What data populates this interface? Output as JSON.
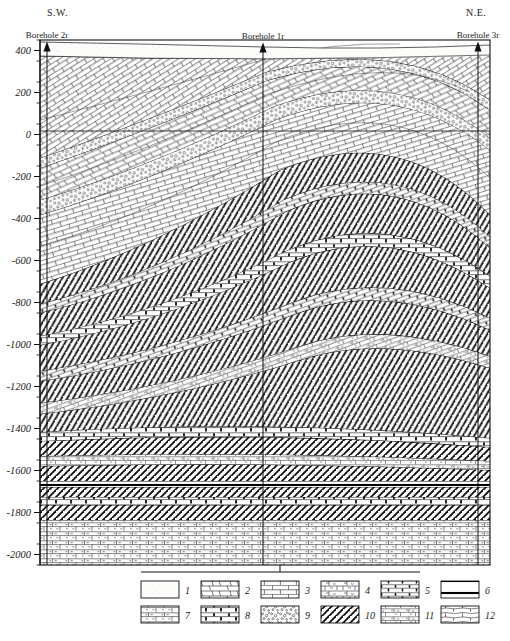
{
  "figure": {
    "orientation_left": "S.W.",
    "orientation_right": "N.E.",
    "depth_axis_unit": "m",
    "frame": {
      "x": 40,
      "y": 40,
      "width": 450,
      "height": 525
    }
  },
  "axis": {
    "ticks_labeled": [
      "400",
      "200",
      "0",
      "-200",
      "-400",
      "-600",
      "-800",
      "-1000",
      "-1200",
      "-1400",
      "-1600",
      "-1800",
      "-2000"
    ],
    "values": [
      400,
      200,
      0,
      -200,
      -400,
      -600,
      -800,
      -1000,
      -1200,
      -1400,
      -1600,
      -1800,
      -2000
    ],
    "minor_step": 100,
    "top_value": 450,
    "bottom_value": -2050
  },
  "boreholes": [
    {
      "id": "bh2r",
      "label": "Borehole 2r",
      "x_px": 47,
      "top_value": 400
    },
    {
      "id": "bh1r",
      "label": "Borehole 1r",
      "x_px": 263,
      "top_value": 395
    },
    {
      "id": "bh3r",
      "label": "Borehole 3r",
      "x_px": 478,
      "top_value": 400
    }
  ],
  "legend": {
    "rows": 2,
    "columns": 6,
    "items": [
      {
        "n": "1",
        "pattern": "blank-stipple",
        "name": "swatch-1"
      },
      {
        "n": "2",
        "pattern": "slanted-brick",
        "name": "swatch-2"
      },
      {
        "n": "3",
        "pattern": "regular-brick",
        "name": "swatch-3"
      },
      {
        "n": "4",
        "pattern": "brick-squiggle",
        "name": "swatch-4"
      },
      {
        "n": "5",
        "pattern": "brick-vertical-tick",
        "name": "swatch-5"
      },
      {
        "n": "6",
        "pattern": "double-heavy-line",
        "name": "swatch-6"
      },
      {
        "n": "7",
        "pattern": "brick-dash",
        "name": "swatch-7"
      },
      {
        "n": "8",
        "pattern": "brick-thick-joint",
        "name": "swatch-8"
      },
      {
        "n": "9",
        "pattern": "conglomerate-dots",
        "name": "swatch-9"
      },
      {
        "n": "10",
        "pattern": "diagonal-hatch",
        "name": "swatch-10"
      },
      {
        "n": "11",
        "pattern": "brick-fine-squiggle",
        "name": "swatch-11"
      },
      {
        "n": "12",
        "pattern": "brick-wavy",
        "name": "swatch-12"
      }
    ]
  },
  "chart_data": {
    "type": "cross-section",
    "xlabel": "",
    "ylabel": "Elevation (m)",
    "ylim": [
      -2050,
      450
    ],
    "grid": false,
    "structure": "Asymmetric anticline with crest beneath the NE half; gently dipping cover beds above, strongly folded hatched/brick alternation in the core, flat-lying beds at depth.",
    "strata": [
      {
        "unit": 1,
        "legend": "1",
        "name": "topsoil-quaternary",
        "top_at_bh2r": 400,
        "base_at_bh2r": 370,
        "fold": "flat"
      },
      {
        "unit": 2,
        "legend": "2",
        "name": "upper-limestone",
        "top_at_bh2r": 370,
        "base_at_bh2r": 120,
        "fold": "gentle-dip-NE"
      },
      {
        "unit": 3,
        "legend": "9",
        "name": "marker-conglomerate-A",
        "top_at_bh2r": 120,
        "base_at_bh2r": 60,
        "fold": "gentle-dip-NE"
      },
      {
        "unit": 4,
        "legend": "3",
        "name": "massive-limestone",
        "top_at_bh2r": 60,
        "base_at_bh2r": -150,
        "fold": "gentle-dip-NE"
      },
      {
        "unit": 5,
        "legend": "9",
        "name": "marker-conglomerate-B",
        "top_at_bh2r": -150,
        "base_at_bh2r": -215,
        "fold": "gentle-dip-NE"
      },
      {
        "unit": 6,
        "legend": "3",
        "name": "lower-limestone",
        "top_at_bh2r": -215,
        "base_at_bh2r": -760,
        "fold": "gentle-dip-NE"
      },
      {
        "unit": 7,
        "legend": "10",
        "name": "hatched-argillite-1",
        "top_at_bh2r": -760,
        "base_at_bh2r": -960,
        "fold": "anticline"
      },
      {
        "unit": 8,
        "legend": "5",
        "name": "banded-dolomite-1",
        "top_at_bh2r": -960,
        "base_at_bh2r": -1030,
        "fold": "anticline"
      },
      {
        "unit": 9,
        "legend": "10",
        "name": "hatched-argillite-2",
        "top_at_bh2r": -1030,
        "base_at_bh2r": -1180,
        "fold": "anticline"
      },
      {
        "unit": 10,
        "legend": "8",
        "name": "banded-dolomite-2",
        "top_at_bh2r": -1180,
        "base_at_bh2r": -1250,
        "fold": "anticline"
      },
      {
        "unit": 11,
        "legend": "10",
        "name": "hatched-argillite-3",
        "top_at_bh2r": -1250,
        "base_at_bh2r": -1420,
        "fold": "anticline"
      },
      {
        "unit": 12,
        "legend": "11",
        "name": "banded-dolomite-3",
        "top_at_bh2r": -1420,
        "base_at_bh2r": -1500,
        "fold": "gentle-arch"
      },
      {
        "unit": 13,
        "legend": "10",
        "name": "hatched-argillite-4",
        "top_at_bh2r": -1500,
        "base_at_bh2r": -1640,
        "fold": "gentle-arch"
      },
      {
        "unit": 14,
        "legend": "6",
        "name": "marker-bed",
        "top_at_bh2r": -1640,
        "base_at_bh2r": -1680,
        "fold": "flat"
      },
      {
        "unit": 15,
        "legend": "10",
        "name": "hatched-argillite-5",
        "top_at_bh2r": -1680,
        "base_at_bh2r": -1820,
        "fold": "flat"
      },
      {
        "unit": 16,
        "legend": "7",
        "name": "basal-dolomite",
        "top_at_bh2r": -1820,
        "base_at_bh2r": -2050,
        "fold": "flat"
      }
    ]
  }
}
